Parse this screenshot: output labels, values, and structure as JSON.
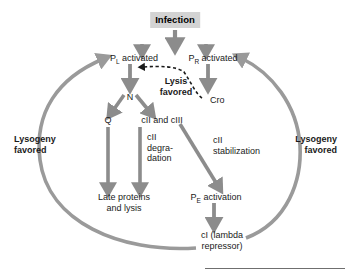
{
  "diagram": {
    "colors": {
      "arrow_gray": "#8c8c8c",
      "arc_gray": "#9a9a9a",
      "dashed_black": "#1a1a1a",
      "infection_box_bg": "#d3d3d3",
      "text": "#1a1a1a",
      "rule": "#6f6f6f"
    },
    "nodes": {
      "infection": "Infection",
      "pl_activated_prefix": "P",
      "pl_activated_sub": "L",
      "pl_activated_suffix": " activated",
      "pr_activated_prefix": "P",
      "pr_activated_sub": "R",
      "pr_activated_suffix": " activated",
      "n": "N",
      "cro": "Cro",
      "q": "Q",
      "cii_ciii": "cII and cIII",
      "late_proteins": "Late proteins\nand lysis",
      "pe_prefix": "P",
      "pe_sub": "E",
      "pe_suffix": " activation",
      "ci_repressor": "cI (lambda\nrepressor)"
    },
    "edge_labels": {
      "lysis_favored": "Lysis\nfavored",
      "cii_degradation": "cII\ndegra-\ndation",
      "cii_stabilization": "cII\nstabilization",
      "lysogeny_favored_left": "Lysogeny\nfavored",
      "lysogeny_favored_right": "Lysogeny\nfavored"
    }
  }
}
